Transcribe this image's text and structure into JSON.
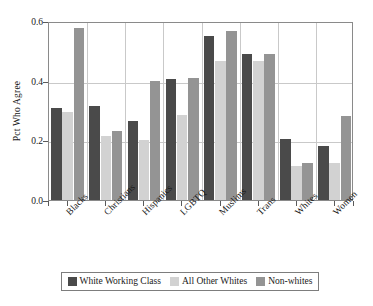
{
  "chart_data": {
    "type": "bar",
    "title": "",
    "xlabel": "",
    "ylabel": "Pct Who Agree",
    "ylim": [
      0.0,
      0.6
    ],
    "yticks": [
      0.0,
      0.2,
      0.4,
      0.6
    ],
    "ytick_labels": [
      "0.0",
      "0.2",
      "0.4",
      "0.6"
    ],
    "grid": true,
    "legend_position": "bottom",
    "categories": [
      "Blacks",
      "Christians",
      "Hispanics",
      "LGBTQ",
      "Muslims",
      "Trans",
      "Whites",
      "Women"
    ],
    "series": [
      {
        "name": "White Working Class",
        "color": "#4a4a4a",
        "values": [
          0.31,
          0.315,
          0.265,
          0.405,
          0.55,
          0.49,
          0.205,
          0.18
        ]
      },
      {
        "name": "All Other Whites",
        "color": "#d2d2d2",
        "values": [
          0.295,
          0.215,
          0.2,
          0.285,
          0.465,
          0.465,
          0.115,
          0.125
        ]
      },
      {
        "name": "Non-whites",
        "color": "#949494",
        "values": [
          0.575,
          0.23,
          0.4,
          0.41,
          0.565,
          0.49,
          0.125,
          0.28
        ]
      }
    ]
  },
  "legend": {
    "items": [
      {
        "label": "White Working Class",
        "color": "#4a4a4a"
      },
      {
        "label": "All Other Whites",
        "color": "#d2d2d2"
      },
      {
        "label": "Non-whites",
        "color": "#949494"
      }
    ]
  }
}
